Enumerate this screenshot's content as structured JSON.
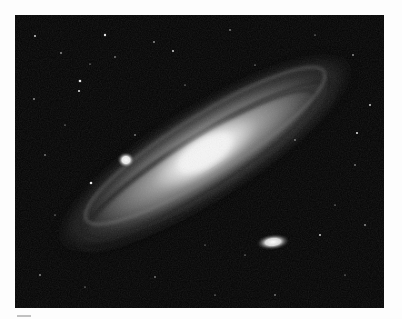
{
  "image": {
    "subject": "spiral galaxy photograph",
    "description": "Grayscale photograph of a large spiral galaxy seen at a steep angle, with two small companion galaxies and a scattering of stars on a black sky",
    "colors": {
      "page_background": "#fdfdfd",
      "sky": "#040404",
      "core": "#f2f2f2",
      "disk": "#9e9e9e",
      "dust_lanes": "#2a2a2a",
      "stars": "#e8e8e8"
    },
    "elements": {
      "main_galaxy": {
        "label": "spiral galaxy",
        "center": [
          190,
          138
        ],
        "tilt_deg": -32
      },
      "companion_upper": {
        "label": "compact companion galaxy",
        "center": [
          111,
          145
        ]
      },
      "companion_lower": {
        "label": "elliptical companion galaxy",
        "center": [
          258,
          227
        ]
      }
    }
  }
}
